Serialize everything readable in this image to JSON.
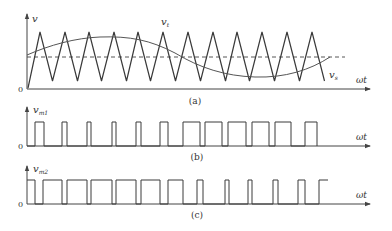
{
  "figure": {
    "colors": {
      "line": "#3a3a3a",
      "axis": "#444444",
      "text": "#333333",
      "background": "#ffffff"
    },
    "panels": [
      {
        "id": "a",
        "caption": "(a)",
        "y_label": "v",
        "x_label": "ωt",
        "origin_label": "0",
        "signals": [
          {
            "name": "carrier",
            "label": "v",
            "subscript": "t",
            "shape": "triangle",
            "peaks_x": [
              40,
              65,
              89,
              114,
              138,
              163,
              188,
              213,
              237,
              262,
              287,
              312
            ]
          },
          {
            "name": "modulating",
            "label": "v",
            "subscript": "s",
            "shape": "sine"
          },
          {
            "name": "reference",
            "shape": "dashed-level"
          }
        ]
      },
      {
        "id": "b",
        "caption": "(b)",
        "y_label": "v",
        "y_subscript": "m1",
        "x_label": "ωt",
        "origin_label": "0",
        "pulses": [
          [
            35,
            44
          ],
          [
            62,
            67
          ],
          [
            87,
            91
          ],
          [
            112,
            116
          ],
          [
            136,
            141
          ],
          [
            160,
            168
          ],
          [
            183,
            200
          ],
          [
            205,
            222
          ],
          [
            228,
            246
          ],
          [
            252,
            269
          ],
          [
            275,
            291
          ],
          [
            305,
            317
          ]
        ]
      },
      {
        "id": "c",
        "caption": "(c)",
        "y_label": "v",
        "y_subscript": "m2",
        "x_label": "ωt",
        "origin_label": "0",
        "pulses": [
          [
            27,
            35
          ],
          [
            43,
            62
          ],
          [
            67,
            87
          ],
          [
            91,
            112
          ],
          [
            116,
            136
          ],
          [
            141,
            160
          ],
          [
            168,
            183
          ],
          [
            197,
            203
          ],
          [
            225,
            229
          ],
          [
            248,
            252
          ],
          [
            273,
            278
          ],
          [
            298,
            305
          ],
          [
            319,
            328
          ]
        ]
      }
    ]
  }
}
